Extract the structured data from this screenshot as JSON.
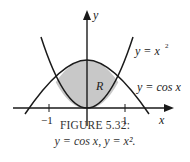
{
  "figure": {
    "caption_title": "FIGURE 5.32:",
    "caption_subtitle": "y = cos x, y = x².",
    "axes": {
      "x_label": "x",
      "y_label": "y",
      "x_ticks": [
        "−1",
        "1"
      ]
    },
    "curves": [
      {
        "name": "parabola",
        "label": "y = x",
        "label_sup": "2"
      },
      {
        "name": "cosine",
        "label": "y = cos x"
      }
    ],
    "region": {
      "label": "R",
      "fill": "#c8c8c8"
    },
    "colors": {
      "stroke": "#1a1a1a",
      "fill": "#c8c8c8",
      "text": "#222222"
    }
  }
}
